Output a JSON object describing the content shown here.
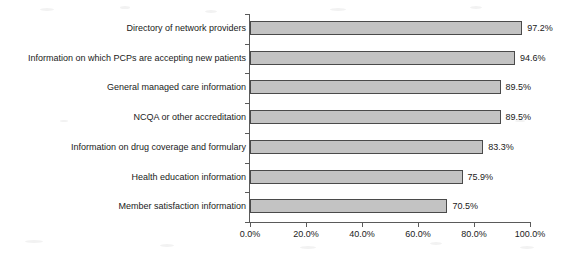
{
  "chart_data": {
    "type": "bar",
    "orientation": "horizontal",
    "title": "",
    "subtitle": "",
    "xlabel": "",
    "ylabel": "",
    "xlim": [
      0,
      100
    ],
    "grid": false,
    "legend": false,
    "legend_position": "none",
    "bar_fill_color": "#c3c3c3",
    "bar_border_color": "#4a4a4a",
    "axis_color": "#5a5a5a",
    "background_color": "#ffffff",
    "value_suffix": "%",
    "categories": [
      "Directory of network providers",
      "Information on which PCPs are accepting new patients",
      "General managed care information",
      "NCQA or other accreditation",
      "Information on drug coverage and formulary",
      "Health education information",
      "Member satisfaction information"
    ],
    "values": [
      97.2,
      94.6,
      89.5,
      89.5,
      83.3,
      75.9,
      70.5
    ],
    "data_labels": [
      "97.2%",
      "94.6%",
      "89.5%",
      "89.5%",
      "83.3%",
      "75.9%",
      "70.5%"
    ],
    "xticks": [
      0,
      20,
      40,
      60,
      80,
      100
    ],
    "xtick_labels": [
      "0.0%",
      "20.0%",
      "40.0%",
      "60.0%",
      "80.0%",
      "100.0%"
    ]
  }
}
